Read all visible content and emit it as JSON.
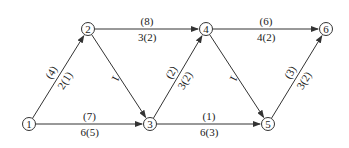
{
  "colors": {
    "line": "#333333",
    "text": "#222222",
    "background": "#ffffff"
  },
  "nodes": [
    {
      "id": "1",
      "x": 29,
      "y": 124
    },
    {
      "id": "2",
      "x": 88,
      "y": 29
    },
    {
      "id": "3",
      "x": 150,
      "y": 124
    },
    {
      "id": "4",
      "x": 206,
      "y": 29
    },
    {
      "id": "5",
      "x": 268,
      "y": 124
    },
    {
      "id": "6",
      "x": 326,
      "y": 29
    }
  ],
  "edges": [
    {
      "from": "1",
      "to": "2",
      "upper": "(4)",
      "lower": "2(1)"
    },
    {
      "from": "1",
      "to": "3",
      "upper": "(7)",
      "lower": "6(5)"
    },
    {
      "from": "2",
      "to": "3",
      "upper": "",
      "lower": "1"
    },
    {
      "from": "2",
      "to": "4",
      "upper": "(8)",
      "lower": "3(2)"
    },
    {
      "from": "3",
      "to": "4",
      "upper": "(2)",
      "lower": "3(2)"
    },
    {
      "from": "3",
      "to": "5",
      "upper": "(1)",
      "lower": "6(3)"
    },
    {
      "from": "4",
      "to": "5",
      "upper": "",
      "lower": "1"
    },
    {
      "from": "4",
      "to": "6",
      "upper": "(6)",
      "lower": "4(2)"
    },
    {
      "from": "5",
      "to": "6",
      "upper": "(3)",
      "lower": "3(2)"
    }
  ]
}
